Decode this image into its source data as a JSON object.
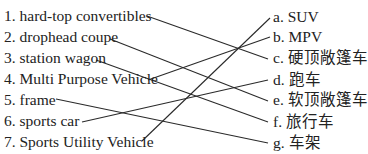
{
  "exercise": {
    "left_items": [
      {
        "label": "1. hard-top convertibles"
      },
      {
        "label": "2. drophead coupe"
      },
      {
        "label": "3. station wagon"
      },
      {
        "label": "4. Multi Purpose Vehicle"
      },
      {
        "label": "5. frame"
      },
      {
        "label": "6. sports car"
      },
      {
        "label": "7. Sports Utility Vehicle"
      }
    ],
    "right_items": [
      {
        "label": "a. SUV"
      },
      {
        "label": "b. MPV"
      },
      {
        "label": "c.  硬顶敞篷车"
      },
      {
        "label": "d.  跑车"
      },
      {
        "label": "e.  软顶敞篷车"
      },
      {
        "label": "f.  旅行车"
      },
      {
        "label": "g.  车架"
      }
    ],
    "matches": [
      {
        "left": "1",
        "right": "c"
      },
      {
        "left": "2",
        "right": "e"
      },
      {
        "left": "3",
        "right": "f"
      },
      {
        "left": "4",
        "right": "b"
      },
      {
        "left": "5",
        "right": "g"
      },
      {
        "left": "6",
        "right": "d"
      },
      {
        "left": "7",
        "right": "a"
      }
    ],
    "line_color": "#2a2a2a",
    "text_color": "#222222"
  }
}
